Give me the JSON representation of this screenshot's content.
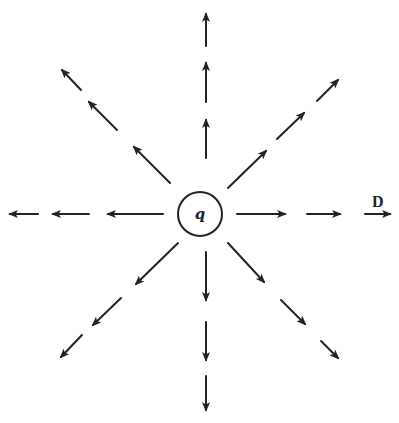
{
  "diagram": {
    "charge": {
      "label": "q",
      "cx": 200,
      "cy": 214,
      "r": 22
    },
    "field_label": {
      "text": "D",
      "x": 372,
      "y": 207
    },
    "colors": {
      "ink": "#222222",
      "background": "#ffffff"
    },
    "rays": [
      {
        "name": "up",
        "segments": [
          [
            206,
            158,
            206,
            120
          ],
          [
            206,
            102,
            206,
            63
          ],
          [
            206,
            46,
            206,
            14
          ]
        ]
      },
      {
        "name": "down",
        "segments": [
          [
            206,
            252,
            206,
            300
          ],
          [
            206,
            322,
            206,
            360
          ],
          [
            206,
            376,
            206,
            410
          ]
        ]
      },
      {
        "name": "left",
        "segments": [
          [
            163,
            214,
            108,
            214
          ],
          [
            89,
            214,
            53,
            214
          ],
          [
            38,
            214,
            10,
            214
          ]
        ]
      },
      {
        "name": "right",
        "segments": [
          [
            237,
            214,
            285,
            214
          ],
          [
            307,
            214,
            340,
            214
          ],
          [
            365,
            214,
            390,
            214
          ]
        ]
      },
      {
        "name": "up-left",
        "segments": [
          [
            170,
            183,
            134,
            147
          ],
          [
            117,
            130,
            89,
            102
          ],
          [
            81,
            90,
            62,
            70
          ]
        ]
      },
      {
        "name": "up-right",
        "segments": [
          [
            228,
            188,
            266,
            151
          ],
          [
            277,
            139,
            304,
            113
          ],
          [
            317,
            101,
            338,
            80
          ]
        ]
      },
      {
        "name": "down-left",
        "segments": [
          [
            178,
            243,
            136,
            284
          ],
          [
            121,
            298,
            93,
            325
          ],
          [
            82,
            335,
            61,
            357
          ]
        ]
      },
      {
        "name": "down-right",
        "segments": [
          [
            228,
            243,
            264,
            282
          ],
          [
            281,
            300,
            305,
            324
          ],
          [
            321,
            341,
            338,
            358
          ]
        ]
      }
    ]
  }
}
